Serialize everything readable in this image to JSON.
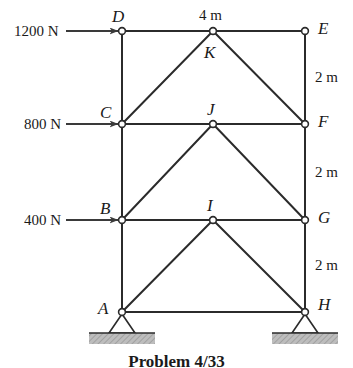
{
  "figure": {
    "caption": "Problem 4/33",
    "caption_top": 352,
    "stroke_color": "#2b2b2b",
    "ground_fill": "#b9b9b9",
    "node_fill": "#ffffff"
  },
  "geometry": {
    "left_x": 122,
    "mid_x": 213,
    "right_x": 305,
    "row_y": [
      31,
      124,
      220,
      312
    ]
  },
  "nodes": [
    {
      "id": "A",
      "label": "A",
      "x": 122,
      "y": 312,
      "label_x": 98,
      "label_y": 300,
      "support": "pin"
    },
    {
      "id": "B",
      "label": "B",
      "x": 122,
      "y": 220,
      "label_x": 100,
      "label_y": 200,
      "support": "none"
    },
    {
      "id": "C",
      "label": "C",
      "x": 122,
      "y": 124,
      "label_x": 100,
      "label_y": 104,
      "support": "none"
    },
    {
      "id": "D",
      "label": "D",
      "x": 122,
      "y": 31,
      "label_x": 112,
      "label_y": 8,
      "support": "none"
    },
    {
      "id": "E",
      "label": "E",
      "x": 305,
      "y": 31,
      "label_x": 318,
      "label_y": 20,
      "support": "none"
    },
    {
      "id": "F",
      "label": "F",
      "x": 305,
      "y": 124,
      "label_x": 318,
      "label_y": 113,
      "support": "none"
    },
    {
      "id": "G",
      "label": "G",
      "x": 305,
      "y": 220,
      "label_x": 318,
      "label_y": 209,
      "support": "none"
    },
    {
      "id": "H",
      "label": "H",
      "x": 305,
      "y": 312,
      "label_x": 318,
      "label_y": 296,
      "support": "pin"
    },
    {
      "id": "I",
      "label": "I",
      "x": 213,
      "y": 220,
      "label_x": 207,
      "label_y": 197,
      "support": "none"
    },
    {
      "id": "J",
      "label": "J",
      "x": 213,
      "y": 124,
      "label_x": 207,
      "label_y": 101,
      "support": "none"
    },
    {
      "id": "K",
      "label": "K",
      "x": 213,
      "y": 31,
      "label_x": 204,
      "label_y": 44,
      "support": "none"
    }
  ],
  "members": [
    {
      "from": "A",
      "to": "B"
    },
    {
      "from": "B",
      "to": "C"
    },
    {
      "from": "C",
      "to": "D"
    },
    {
      "from": "H",
      "to": "G"
    },
    {
      "from": "G",
      "to": "F"
    },
    {
      "from": "F",
      "to": "E"
    },
    {
      "from": "A",
      "to": "H"
    },
    {
      "from": "B",
      "to": "G"
    },
    {
      "from": "C",
      "to": "F"
    },
    {
      "from": "D",
      "to": "E"
    },
    {
      "from": "A",
      "to": "I"
    },
    {
      "from": "I",
      "to": "H"
    },
    {
      "from": "B",
      "to": "J"
    },
    {
      "from": "J",
      "to": "G"
    },
    {
      "from": "C",
      "to": "K"
    },
    {
      "from": "K",
      "to": "F"
    }
  ],
  "loads": [
    {
      "id": "load-d",
      "label": "1200 N",
      "node": "D",
      "text_x": 14,
      "text_y": 24,
      "arrow_x1": 66,
      "arrow_x2": 118,
      "arrow_y": 31
    },
    {
      "id": "load-c",
      "label": "800 N",
      "node": "C",
      "text_x": 24,
      "text_y": 117,
      "arrow_x1": 66,
      "arrow_x2": 118,
      "arrow_y": 124
    },
    {
      "id": "load-b",
      "label": "400 N",
      "node": "B",
      "text_x": 24,
      "text_y": 213,
      "arrow_x1": 66,
      "arrow_x2": 118,
      "arrow_y": 220
    }
  ],
  "dimensions": [
    {
      "id": "span-top",
      "label": "4 m",
      "x": 199,
      "y": 8
    },
    {
      "id": "height-e-f",
      "label": "2 m",
      "x": 315,
      "y": 70
    },
    {
      "id": "height-f-g",
      "label": "2 m",
      "x": 315,
      "y": 165
    },
    {
      "id": "height-g-h",
      "label": "2 m",
      "x": 315,
      "y": 258
    }
  ]
}
